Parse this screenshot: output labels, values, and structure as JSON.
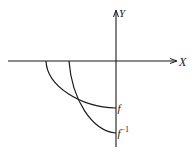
{
  "diagram": {
    "axes": {
      "x_label": "X",
      "y_label": "Y"
    },
    "curves": [
      {
        "name": "f",
        "label": "f"
      },
      {
        "name": "f-inverse",
        "label": "f",
        "superscript": "−1"
      }
    ],
    "colors": {
      "stroke": "#1a1a1a",
      "background": "#ffffff"
    }
  }
}
